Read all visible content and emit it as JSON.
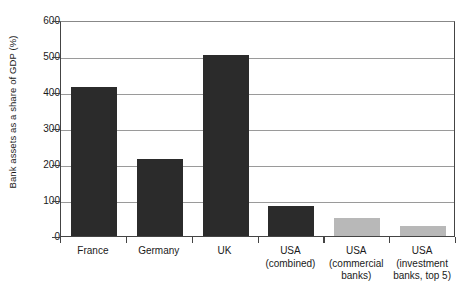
{
  "chart_data": {
    "type": "bar",
    "title": "",
    "subtitle": "",
    "xlabel": "",
    "ylabel": "Bank assets as a share of GDP (%)",
    "ylim": [
      0,
      600
    ],
    "yticks": [
      0,
      100,
      200,
      300,
      400,
      500,
      600
    ],
    "ytick_labels": [
      "0",
      "100",
      "200",
      "300",
      "400",
      "500",
      "600"
    ],
    "grid": "horizontal",
    "legend": "none",
    "categories": [
      "France",
      "Germany",
      "UK",
      "USA (combined)",
      "USA (commercial banks)",
      "USA (investment banks, top 5)"
    ],
    "category_lines": [
      [
        "France",
        ""
      ],
      [
        "Germany",
        ""
      ],
      [
        "UK",
        ""
      ],
      [
        "USA",
        "(combined)"
      ],
      [
        "USA",
        "(commercial",
        "banks)"
      ],
      [
        "USA",
        "(investment",
        "banks, top 5)"
      ]
    ],
    "values": [
      415,
      214,
      503,
      83,
      50,
      28
    ],
    "bar_colors": [
      "dark",
      "dark",
      "dark",
      "dark",
      "light",
      "light"
    ],
    "colors": {
      "dark": "#2b2b2b",
      "light": "#b8b8b8",
      "axis": "#444444",
      "gridline": "#9a9a9a",
      "background": "#ffffff",
      "text": "#1a1a1a"
    }
  }
}
